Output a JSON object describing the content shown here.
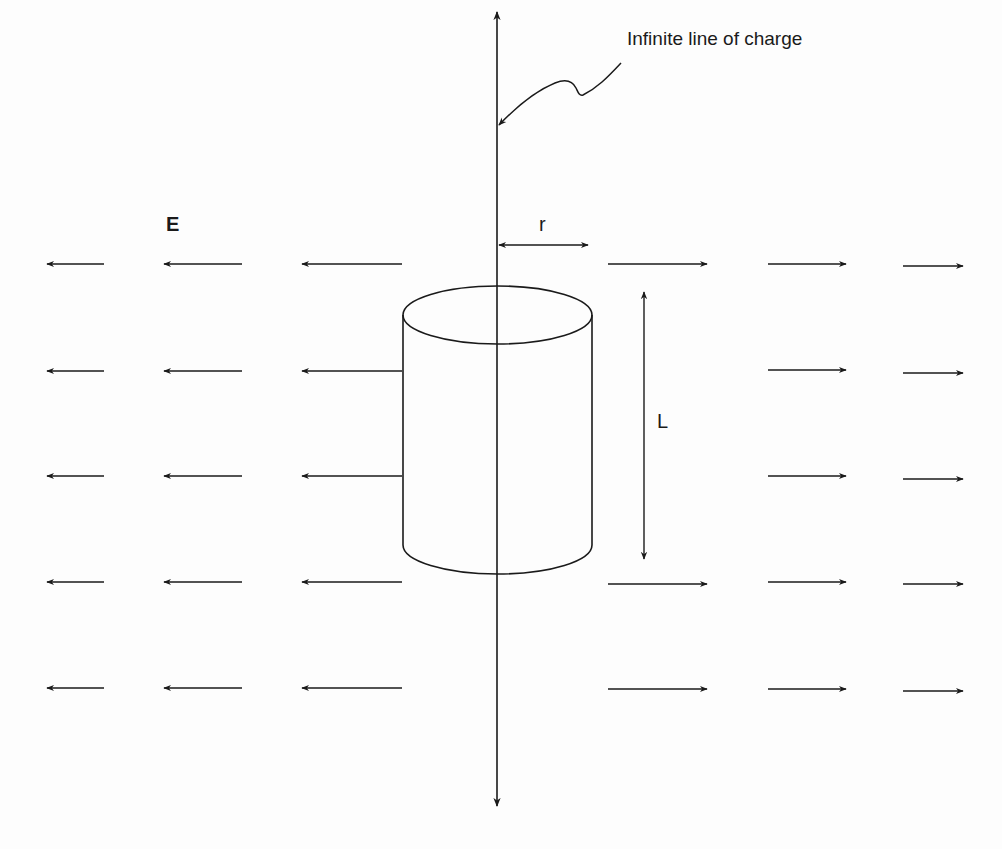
{
  "diagram": {
    "labels": {
      "line_of_charge": "Infinite line of charge",
      "field": "E",
      "radius": "r",
      "length": "L"
    },
    "colors": {
      "stroke": "#1a1a1a",
      "background": "#fdfdfd"
    },
    "line_of_charge": {
      "x": 497,
      "y_top": 8,
      "y_bottom": 808
    },
    "cylinder": {
      "left": 403,
      "right": 592,
      "top_center_y": 315,
      "bottom_center_y": 545,
      "ellipse_ry": 29
    },
    "field_rows_y": [
      264,
      370,
      476,
      582,
      688
    ],
    "left_arrows_x": [
      [
        47,
        104
      ],
      [
        164,
        242
      ],
      [
        302,
        402
      ]
    ],
    "right_arrows_x": [
      [
        608,
        707
      ],
      [
        768,
        846
      ],
      [
        903,
        963
      ]
    ]
  }
}
